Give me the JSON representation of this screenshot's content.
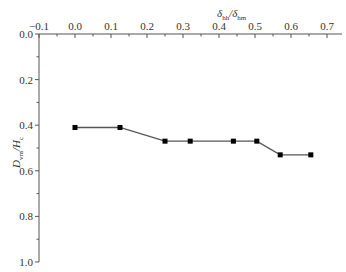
{
  "chart_data": {
    "type": "line",
    "title": "",
    "xlabel": "δ_hh/δ_hm",
    "ylabel": "D_vm/H_c",
    "x_axis_position": "top",
    "y_axis_inverted": true,
    "xlim": [
      -0.1,
      0.75
    ],
    "ylim": [
      0.0,
      1.0
    ],
    "xticks": [
      "-0.1",
      "0.0",
      "0.1",
      "0.2",
      "0.3",
      "0.4",
      "0.5",
      "0.6",
      "0.7"
    ],
    "yticks": [
      "0.0",
      "0.2",
      "0.4",
      "0.6",
      "0.8",
      "1.0"
    ],
    "grid": false,
    "legend": null,
    "series": [
      {
        "name": "D_vm/H_c",
        "marker": "square",
        "color": "#000000",
        "line_color": "#555555",
        "x": [
          0.0,
          0.125,
          0.25,
          0.32,
          0.44,
          0.505,
          0.57,
          0.655
        ],
        "y": [
          0.41,
          0.41,
          0.47,
          0.47,
          0.47,
          0.47,
          0.53,
          0.53
        ]
      }
    ]
  },
  "labels": {
    "x_title_main": "δ",
    "x_title_sub1": "hh",
    "x_title_slash": "/δ",
    "x_title_sub2": "hm",
    "y_title_main": "D",
    "y_title_sub1": "vm",
    "y_title_slash": "/H",
    "y_title_sub2": "c"
  }
}
